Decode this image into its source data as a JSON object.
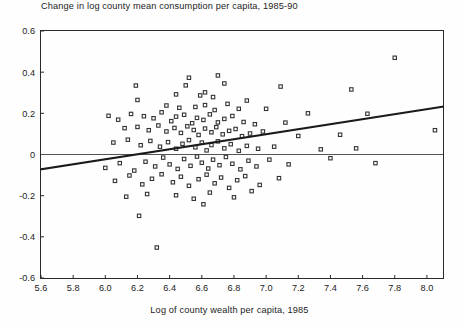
{
  "chart_data": {
    "type": "scatter",
    "title": "Change in log county mean consumption per capita, 1985-90",
    "xlabel": "Log of county wealth per capita, 1985",
    "ylabel": "",
    "xlim": [
      5.6,
      8.1
    ],
    "ylim": [
      -0.6,
      0.6
    ],
    "xticks": [
      "5.6",
      "5.8",
      "6.0",
      "6.2",
      "6.4",
      "6.6",
      "6.8",
      "7.0",
      "7.2",
      "7.4",
      "7.6",
      "7.8",
      "8.0"
    ],
    "xtick_values": [
      5.6,
      5.8,
      6.0,
      6.2,
      6.4,
      6.6,
      6.8,
      7.0,
      7.2,
      7.4,
      7.6,
      7.8,
      8.0
    ],
    "yticks": [
      "0.6",
      "0.4",
      "0.2",
      "0",
      "-0.2",
      "-0.4",
      "-0.6"
    ],
    "ytick_values": [
      0.6,
      0.4,
      0.2,
      0,
      -0.2,
      -0.4,
      -0.6
    ],
    "grid": false,
    "legend": null,
    "marker": "open-square",
    "marker_color": "#333333",
    "reference_line": {
      "type": "horizontal",
      "y": 0,
      "color": "#555555"
    },
    "fit_line": {
      "type": "linear-regression",
      "color": "#1a1a1a",
      "x_start": 5.6,
      "y_start": -0.072,
      "x_end": 8.1,
      "y_end": 0.232,
      "slope": 0.1216,
      "intercept": -0.753
    },
    "points": [
      [
        6.19,
        0.335
      ],
      [
        6.2,
        0.265
      ],
      [
        6.44,
        0.292
      ],
      [
        6.5,
        0.336
      ],
      [
        6.52,
        0.373
      ],
      [
        6.59,
        0.287
      ],
      [
        6.62,
        0.302
      ],
      [
        6.67,
        0.279
      ],
      [
        6.7,
        0.384
      ],
      [
        6.74,
        0.345
      ],
      [
        7.09,
        0.33
      ],
      [
        7.53,
        0.316
      ],
      [
        7.8,
        0.47
      ],
      [
        6.38,
        0.238
      ],
      [
        6.46,
        0.227
      ],
      [
        6.56,
        0.231
      ],
      [
        6.62,
        0.24
      ],
      [
        6.68,
        0.216
      ],
      [
        6.76,
        0.246
      ],
      [
        6.83,
        0.222
      ],
      [
        6.88,
        0.262
      ],
      [
        7.0,
        0.222
      ],
      [
        7.26,
        0.2
      ],
      [
        7.63,
        0.198
      ],
      [
        6.02,
        0.188
      ],
      [
        6.08,
        0.169
      ],
      [
        6.16,
        0.197
      ],
      [
        6.24,
        0.186
      ],
      [
        6.3,
        0.176
      ],
      [
        6.35,
        0.205
      ],
      [
        6.41,
        0.162
      ],
      [
        6.44,
        0.184
      ],
      [
        6.49,
        0.193
      ],
      [
        6.54,
        0.152
      ],
      [
        6.57,
        0.178
      ],
      [
        6.61,
        0.168
      ],
      [
        6.65,
        0.195
      ],
      [
        6.7,
        0.156
      ],
      [
        6.74,
        0.173
      ],
      [
        6.79,
        0.187
      ],
      [
        6.86,
        0.158
      ],
      [
        6.93,
        0.147
      ],
      [
        7.12,
        0.155
      ],
      [
        6.12,
        0.128
      ],
      [
        6.2,
        0.134
      ],
      [
        6.27,
        0.118
      ],
      [
        6.33,
        0.141
      ],
      [
        6.38,
        0.112
      ],
      [
        6.43,
        0.129
      ],
      [
        6.47,
        0.105
      ],
      [
        6.51,
        0.137
      ],
      [
        6.55,
        0.119
      ],
      [
        6.58,
        0.095
      ],
      [
        6.62,
        0.126
      ],
      [
        6.66,
        0.108
      ],
      [
        6.69,
        0.133
      ],
      [
        6.73,
        0.098
      ],
      [
        6.77,
        0.115
      ],
      [
        6.81,
        0.124
      ],
      [
        6.85,
        0.089
      ],
      [
        6.9,
        0.102
      ],
      [
        6.98,
        0.112
      ],
      [
        7.2,
        0.09
      ],
      [
        7.46,
        0.096
      ],
      [
        8.05,
        0.118
      ],
      [
        6.05,
        0.058
      ],
      [
        6.14,
        0.072
      ],
      [
        6.22,
        0.045
      ],
      [
        6.28,
        0.066
      ],
      [
        6.34,
        0.038
      ],
      [
        6.39,
        0.06
      ],
      [
        6.44,
        0.028
      ],
      [
        6.48,
        0.052
      ],
      [
        6.52,
        0.07
      ],
      [
        6.56,
        0.035
      ],
      [
        6.6,
        0.058
      ],
      [
        6.63,
        0.02
      ],
      [
        6.66,
        0.046
      ],
      [
        6.7,
        0.064
      ],
      [
        6.74,
        0.03
      ],
      [
        6.78,
        0.05
      ],
      [
        6.83,
        0.018
      ],
      [
        6.88,
        0.042
      ],
      [
        6.95,
        0.028
      ],
      [
        7.05,
        0.038
      ],
      [
        7.34,
        0.025
      ],
      [
        7.56,
        0.03
      ],
      [
        6.0,
        -0.065
      ],
      [
        6.09,
        -0.042
      ],
      [
        6.18,
        -0.078
      ],
      [
        6.25,
        -0.035
      ],
      [
        6.31,
        -0.058
      ],
      [
        6.36,
        -0.015
      ],
      [
        6.4,
        -0.048
      ],
      [
        6.45,
        -0.07
      ],
      [
        6.49,
        -0.022
      ],
      [
        6.53,
        -0.055
      ],
      [
        6.57,
        -0.01
      ],
      [
        6.6,
        -0.04
      ],
      [
        6.64,
        -0.068
      ],
      [
        6.67,
        -0.025
      ],
      [
        6.71,
        -0.052
      ],
      [
        6.75,
        -0.012
      ],
      [
        6.79,
        -0.045
      ],
      [
        6.84,
        -0.072
      ],
      [
        6.89,
        -0.03
      ],
      [
        6.94,
        -0.058
      ],
      [
        7.02,
        -0.025
      ],
      [
        7.14,
        -0.048
      ],
      [
        7.4,
        -0.018
      ],
      [
        7.68,
        -0.042
      ],
      [
        6.06,
        -0.128
      ],
      [
        6.15,
        -0.102
      ],
      [
        6.23,
        -0.145
      ],
      [
        6.29,
        -0.118
      ],
      [
        6.35,
        -0.096
      ],
      [
        6.42,
        -0.135
      ],
      [
        6.47,
        -0.108
      ],
      [
        6.52,
        -0.152
      ],
      [
        6.58,
        -0.12
      ],
      [
        6.63,
        -0.098
      ],
      [
        6.68,
        -0.14
      ],
      [
        6.72,
        -0.112
      ],
      [
        6.77,
        -0.162
      ],
      [
        6.82,
        -0.125
      ],
      [
        6.87,
        -0.105
      ],
      [
        6.96,
        -0.148
      ],
      [
        7.08,
        -0.115
      ],
      [
        6.13,
        -0.205
      ],
      [
        6.26,
        -0.192
      ],
      [
        6.44,
        -0.198
      ],
      [
        6.55,
        -0.215
      ],
      [
        6.65,
        -0.185
      ],
      [
        6.8,
        -0.208
      ],
      [
        6.91,
        -0.178
      ],
      [
        6.21,
        -0.298
      ],
      [
        6.32,
        -0.452
      ],
      [
        6.61,
        -0.242
      ]
    ]
  }
}
